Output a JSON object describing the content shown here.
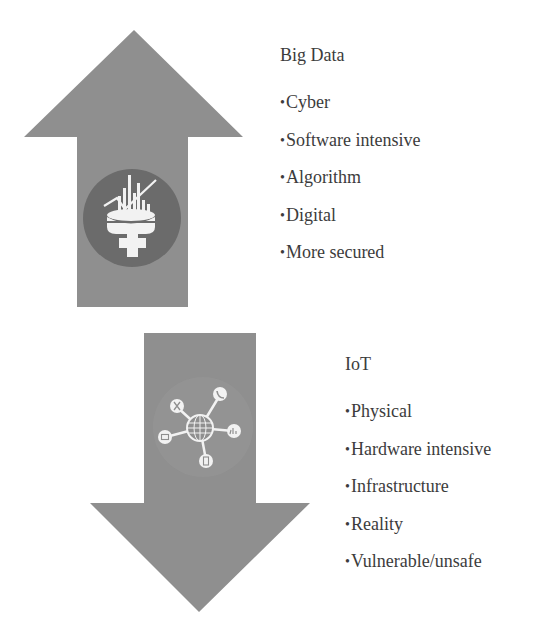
{
  "colors": {
    "arrow_fill": "#8f8f8f",
    "icon_circle_fill": "#6b6b6b",
    "iot_circle_fill": "#999999",
    "icon_glyph": "#f2f2f2",
    "text": "#3c3c3c",
    "background": "#ffffff"
  },
  "big_data": {
    "title": "Big Data",
    "arrow_direction": "up",
    "icon": "database-analytics-icon",
    "bullet": "•",
    "items": [
      "Cyber",
      "Software intensive",
      "Algorithm",
      "Digital",
      "More secured"
    ]
  },
  "iot": {
    "title": "IoT",
    "arrow_direction": "down",
    "icon": "network-globe-icon",
    "bullet": "•",
    "items": [
      "Physical",
      "Hardware intensive",
      "Infrastructure",
      "Reality",
      "Vulnerable/unsafe"
    ]
  }
}
